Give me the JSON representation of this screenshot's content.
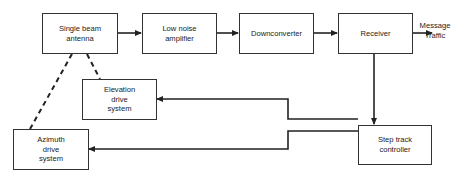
{
  "diagram": {
    "blocks": {
      "antenna": "Single beam\nantenna",
      "lna": "Low noise\namplifier",
      "downconverter": "Downconverter",
      "receiver": "Receiver",
      "elevation": "Elevation\ndrive\nsystem",
      "azimuth": "Azimuth\ndrive\nsystem",
      "steptrack": "Step track\ncontroller"
    },
    "output_label": "Message\nTraffic",
    "connections": [
      {
        "from": "antenna",
        "to": "lna",
        "style": "solid-arrow"
      },
      {
        "from": "lna",
        "to": "downconverter",
        "style": "solid-arrow"
      },
      {
        "from": "downconverter",
        "to": "receiver",
        "style": "solid-arrow"
      },
      {
        "from": "receiver",
        "to": "output",
        "style": "solid-arrow"
      },
      {
        "from": "receiver",
        "to": "steptrack",
        "style": "solid-arrow"
      },
      {
        "from": "steptrack",
        "to": "elevation",
        "style": "solid-arrow"
      },
      {
        "from": "steptrack",
        "to": "azimuth",
        "style": "solid-arrow"
      },
      {
        "from": "elevation",
        "to": "antenna",
        "style": "dashed"
      },
      {
        "from": "azimuth",
        "to": "antenna",
        "style": "dashed"
      }
    ]
  }
}
